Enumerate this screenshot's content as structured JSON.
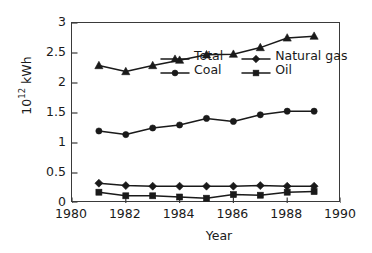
{
  "chart_data": {
    "type": "line",
    "title": "",
    "xlabel": "Year",
    "ylabel": "10^12 kWh",
    "ylabel_base": "10",
    "ylabel_exponent": "12",
    "ylabel_unit": " kWh",
    "xlim": [
      1980,
      1990
    ],
    "ylim": [
      0,
      3
    ],
    "xticks": [
      1980,
      1982,
      1984,
      1986,
      1988,
      1990
    ],
    "xtick_labels": [
      "1980",
      "1982",
      "1984",
      "1986",
      "1988",
      "1990"
    ],
    "yticks": [
      0,
      0.5,
      1,
      1.5,
      2,
      2.5,
      3
    ],
    "ytick_labels": [
      "0",
      "0.5",
      "1",
      "1.5",
      "2",
      "2.5",
      "3"
    ],
    "grid": false,
    "legend_position": "upper-left-inside",
    "x": [
      1981,
      1982,
      1983,
      1984,
      1985,
      1986,
      1987,
      1988,
      1989
    ],
    "series": [
      {
        "name": "Total",
        "marker": "triangle",
        "color": "#1a1a1a",
        "values": [
          2.29,
          2.19,
          2.29,
          2.38,
          2.47,
          2.48,
          2.59,
          2.75,
          2.78
        ]
      },
      {
        "name": "Coal",
        "marker": "circle",
        "color": "#1a1a1a",
        "values": [
          1.2,
          1.14,
          1.25,
          1.3,
          1.41,
          1.36,
          1.47,
          1.53,
          1.53
        ]
      },
      {
        "name": "Natural gas",
        "marker": "diamond",
        "color": "#1a1a1a",
        "values": [
          0.33,
          0.29,
          0.28,
          0.28,
          0.28,
          0.28,
          0.29,
          0.28,
          0.28
        ]
      },
      {
        "name": "Oil",
        "marker": "square",
        "color": "#1a1a1a",
        "values": [
          0.18,
          0.12,
          0.12,
          0.1,
          0.08,
          0.14,
          0.13,
          0.18,
          0.19
        ]
      }
    ]
  }
}
